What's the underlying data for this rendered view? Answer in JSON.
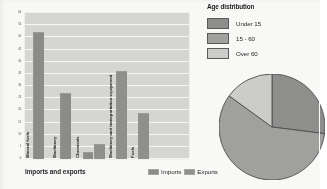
{
  "bar_chart": {
    "title": "Imports and exports",
    "y_axis_title": "Percentage of total",
    "legend": [
      {
        "label": "Imports",
        "color": "#8a8a88"
      },
      {
        "label": "Exports",
        "color": "#8f8f8d"
      }
    ],
    "categories_visible": [
      "Mineral fuels",
      "Machinery",
      "Chemicals",
      "Machinery and transportation equipment",
      "Fuels"
    ]
  },
  "pie_chart": {
    "heading": "Age distribution",
    "legend": [
      {
        "label": "Under 15",
        "color": "#8d8d8b"
      },
      {
        "label": "15 - 60",
        "color": "#a0a09e"
      },
      {
        "label": "Over 60",
        "color": "#cfcfcd"
      }
    ]
  },
  "chart_data": [
    {
      "type": "bar",
      "title": "Imports and exports",
      "xlabel": "",
      "ylabel": "Percentage of total",
      "ylim": [
        0,
        60
      ],
      "yticks": [
        0,
        5,
        10,
        15,
        20,
        25,
        30,
        35,
        40,
        45,
        50,
        55,
        60
      ],
      "ytick_labels": [
        "0",
        "5",
        "10",
        "15",
        "20",
        "25",
        "30",
        "35",
        "40",
        "45",
        "50",
        "55",
        "60"
      ],
      "grid": true,
      "legend_position": "bottom-right",
      "categories": [
        "Mineral fuels",
        "Machinery",
        "Chemicals",
        "",
        "Machinery and transportation equipment",
        "Fuels"
      ],
      "series": [
        {
          "name": "Imports",
          "values": [
            52,
            27,
            3,
            null,
            null,
            null
          ]
        },
        {
          "name": "Exports",
          "values": [
            null,
            null,
            null,
            6,
            36,
            19
          ]
        }
      ],
      "values": [
        52,
        27,
        3,
        6,
        36,
        19
      ]
    },
    {
      "type": "pie",
      "title": "Age distribution",
      "labels": [
        "Under 15",
        "15 - 60",
        "Over 60"
      ],
      "values": [
        27,
        58,
        15
      ],
      "legend_position": "top",
      "note": "right side of pie clipped by page edge"
    }
  ]
}
